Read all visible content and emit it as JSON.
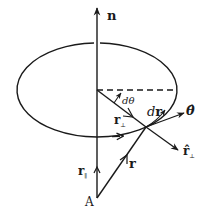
{
  "diagram": {
    "labels": {
      "n": "n",
      "dtheta": "dθ",
      "dr": "dr",
      "d_prefix": "d",
      "r_bold": "r",
      "theta_hat": "θ̂",
      "r_perp": "r",
      "perp_sub": "⊥",
      "r_perp_hat": "r̂",
      "r_par": "r",
      "par_sub": "∥",
      "r": "r",
      "A": "A"
    },
    "colors": {
      "stroke": "#1a1a1a",
      "background": "#ffffff"
    }
  }
}
